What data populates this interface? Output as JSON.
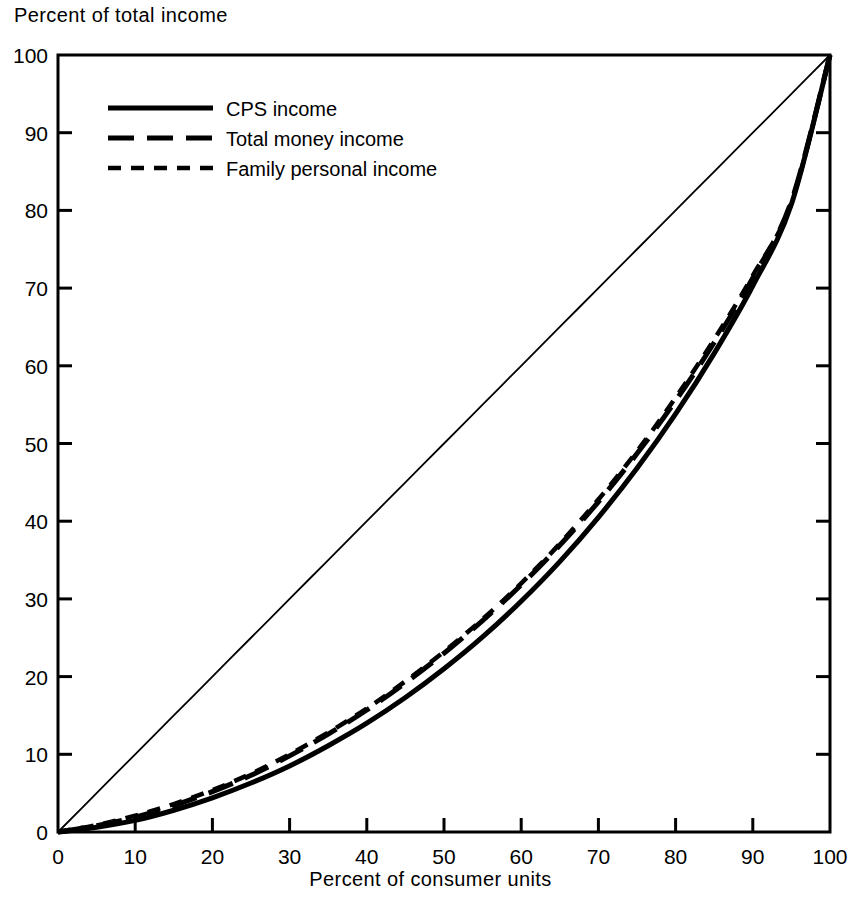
{
  "chart_data": {
    "type": "line",
    "title": "",
    "xlabel": "Percent of consumer units",
    "ylabel": "Percent of total income",
    "xlim": [
      0,
      100
    ],
    "ylim": [
      0,
      100
    ],
    "grid": false,
    "legend_position": "upper-left",
    "xticks": [
      "0",
      "10",
      "20",
      "30",
      "40",
      "50",
      "60",
      "70",
      "80",
      "90",
      "100"
    ],
    "yticks": [
      "0",
      "10",
      "20",
      "30",
      "40",
      "50",
      "60",
      "70",
      "80",
      "90",
      "100"
    ],
    "xtick_values": [
      0,
      10,
      20,
      30,
      40,
      50,
      60,
      70,
      80,
      90,
      100
    ],
    "ytick_values": [
      0,
      10,
      20,
      30,
      40,
      50,
      60,
      70,
      80,
      90,
      100
    ],
    "x": [
      0,
      5,
      10,
      15,
      20,
      25,
      30,
      35,
      40,
      45,
      50,
      55,
      60,
      65,
      70,
      75,
      80,
      85,
      90,
      95,
      100
    ],
    "series": [
      {
        "name": "CPS income",
        "style": "solid",
        "values": [
          0,
          0.6,
          1.5,
          2.8,
          4.4,
          6.3,
          8.5,
          11.1,
          14.0,
          17.3,
          21.0,
          25.1,
          29.7,
          34.8,
          40.5,
          46.8,
          53.8,
          61.6,
          70.3,
          80.8,
          100
        ]
      },
      {
        "name": "Total money income",
        "style": "long-dash",
        "values": [
          0,
          0.8,
          1.9,
          3.4,
          5.2,
          7.3,
          9.8,
          12.6,
          15.7,
          19.2,
          23.0,
          27.2,
          31.8,
          36.9,
          42.5,
          48.7,
          55.5,
          63.0,
          71.3,
          81.2,
          100
        ]
      },
      {
        "name": "Family personal income",
        "style": "short-dash",
        "values": [
          0,
          0.9,
          2.1,
          3.6,
          5.4,
          7.5,
          10.0,
          12.8,
          15.9,
          19.4,
          23.2,
          27.4,
          32.0,
          37.1,
          42.8,
          49.0,
          55.9,
          63.4,
          71.6,
          81.0,
          100
        ]
      },
      {
        "name": "line of equality",
        "style": "thin-solid",
        "values": [
          0,
          5,
          10,
          15,
          20,
          25,
          30,
          35,
          40,
          45,
          50,
          55,
          60,
          65,
          70,
          75,
          80,
          85,
          90,
          95,
          100
        ]
      }
    ],
    "legend": [
      {
        "label": "CPS income",
        "style": "solid"
      },
      {
        "label": "Total money income",
        "style": "long-dash"
      },
      {
        "label": "Family personal income",
        "style": "short-dash"
      }
    ],
    "colors": {
      "line": "#000000",
      "axis": "#000000",
      "background": "#ffffff"
    }
  }
}
